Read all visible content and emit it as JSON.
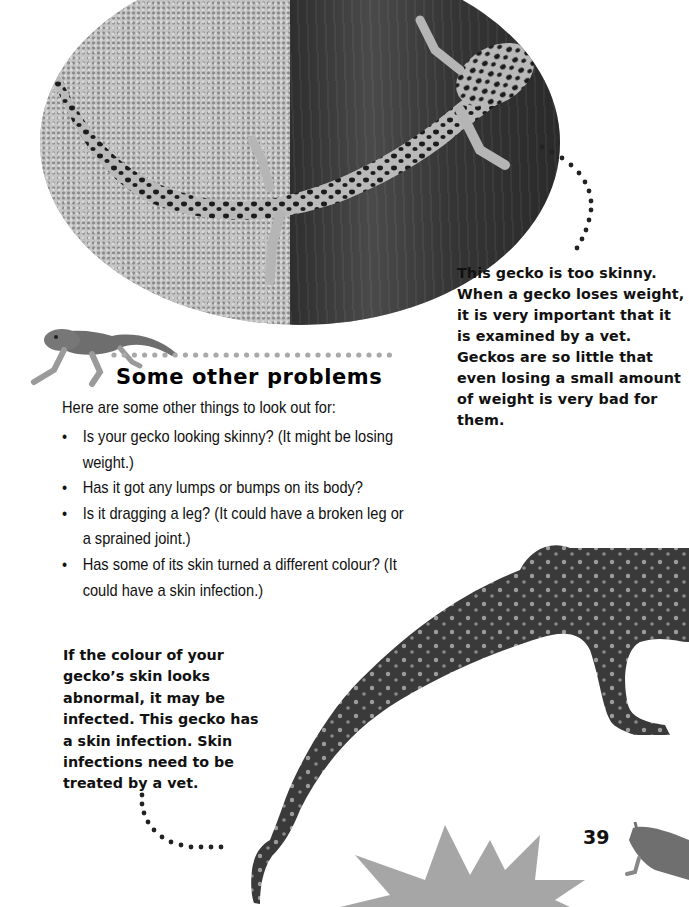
{
  "page": {
    "number": "39"
  },
  "images": {
    "top_photo": "Leopard gecko (too skinny) lying on gravel and wood",
    "heading_gecko": "Small leopard gecko standing",
    "infected_gecko": "Gecko with a skin infection",
    "corner_gecko": "Small leopard gecko peeking from corner"
  },
  "captions": {
    "skinny": "This gecko is too skinny. When a gecko loses weight, it is very important that it is examined by a vet. Geckos are so little that even losing a small amount of weight is very bad for them.",
    "infection": {
      "before": "If the colour of your gecko’s skin looks ",
      "bold": "abnormal",
      "after": ", it may be infected. This gecko has a skin infection. Skin infections need to be treated by a vet."
    }
  },
  "section": {
    "heading": "Some other problems",
    "intro": "Here are some other things to look out for:",
    "bullet_glyph": "•",
    "items": [
      "Is your gecko looking skinny? (It might be losing weight.)",
      "Has it got any lumps or bumps on its body?",
      "Is it dragging a leg? (It could have a broken leg or a sprained joint.)",
      "Has some of its skin turned a different colour? (It could have a skin infection.)"
    ]
  },
  "colors": {
    "text": "#111111",
    "dots_dark": "#222222",
    "dots_light": "#a9a9a9",
    "starburst": "#a6a6a6",
    "background": "#ffffff"
  }
}
